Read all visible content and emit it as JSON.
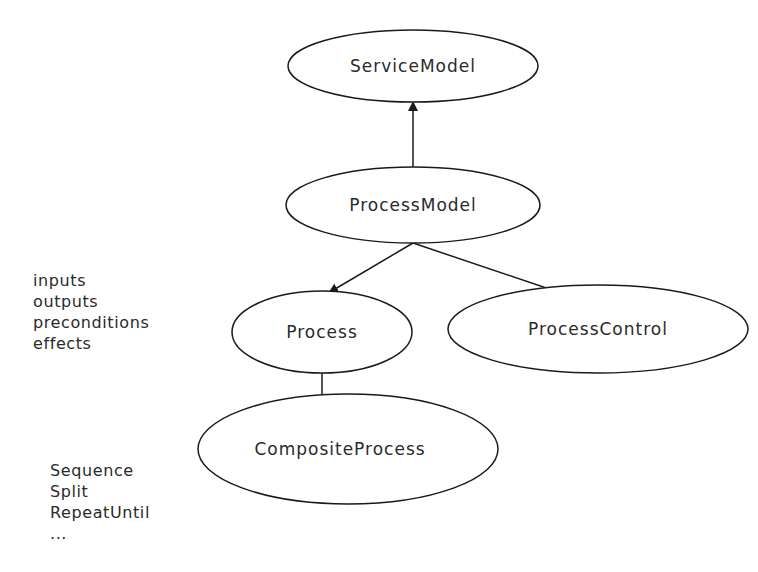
{
  "diagram": {
    "nodes": [
      {
        "id": "service_model",
        "label": "ServiceModel"
      },
      {
        "id": "process_model",
        "label": "ProcessModel"
      },
      {
        "id": "process",
        "label": "Process"
      },
      {
        "id": "process_control",
        "label": "ProcessControl"
      },
      {
        "id": "composite_process",
        "label": "CompositeProcess"
      }
    ],
    "edges": [
      {
        "from": "process_model",
        "to": "service_model",
        "type": "single-arrow"
      },
      {
        "from": "process_model",
        "to": "process",
        "type": "single-arrow"
      },
      {
        "from": "process_model",
        "to": "process_control",
        "type": "single-arrow"
      },
      {
        "from": "process",
        "to": "composite_process",
        "type": "double-arrow"
      }
    ],
    "process_attributes": [
      "inputs",
      "outputs",
      "preconditions",
      "effects"
    ],
    "control_constructs": [
      "Sequence",
      "Split",
      "RepeatUntil",
      "..."
    ]
  }
}
